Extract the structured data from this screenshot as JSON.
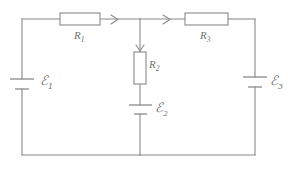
{
  "figure": {
    "line_color": "#8a8a8a",
    "text_color": "#6f6f6f",
    "background": "#ffffff"
  },
  "components": {
    "resistors": [
      {
        "id": "R1",
        "label": "R",
        "subscript": "1",
        "orientation": "horizontal",
        "branch": "top-left"
      },
      {
        "id": "R2",
        "label": "R",
        "subscript": "2",
        "orientation": "vertical",
        "branch": "middle"
      },
      {
        "id": "R3",
        "label": "R",
        "subscript": "3",
        "orientation": "horizontal",
        "branch": "top-right"
      }
    ],
    "sources": [
      {
        "id": "E1",
        "symbol": "ℰ",
        "subscript": "1",
        "orientation": "vertical",
        "branch": "left"
      },
      {
        "id": "E2",
        "symbol": "ℰ",
        "subscript": "2",
        "orientation": "vertical",
        "branch": "middle"
      },
      {
        "id": "E3",
        "symbol": "ℰ",
        "subscript": "3",
        "orientation": "vertical",
        "branch": "right"
      }
    ],
    "current_arrows": [
      {
        "id": "I-left-top",
        "direction": "right",
        "branch": "top-left"
      },
      {
        "id": "I-right-top",
        "direction": "right",
        "branch": "top-right"
      },
      {
        "id": "I-middle",
        "direction": "down",
        "branch": "middle"
      }
    ]
  },
  "labels": {
    "r1": "R",
    "r1_sub": "1",
    "r2": "R",
    "r2_sub": "2",
    "r3": "R",
    "r3_sub": "3",
    "emf1": "ℰ",
    "emf1_sub": "1",
    "emf2": "ℰ",
    "emf2_sub": "2",
    "emf3": "ℰ",
    "emf3_sub": "3"
  }
}
